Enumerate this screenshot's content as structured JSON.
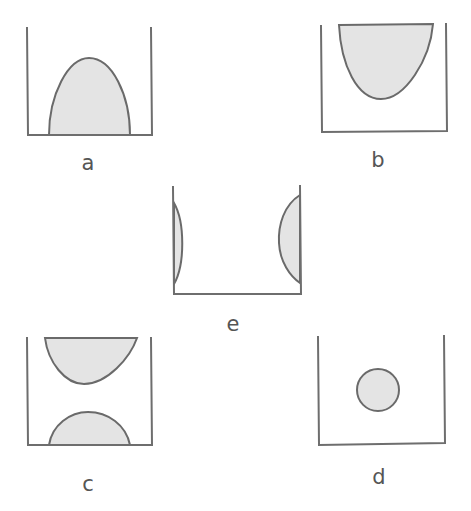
{
  "figure": {
    "colors": {
      "wall": "#6e6e6e",
      "fill": "#e4e4e4",
      "outline": "#6a6a6a",
      "label": "#555555"
    },
    "panels": [
      {
        "id": "a",
        "label": "a",
        "shape": "dome resting on bottom"
      },
      {
        "id": "b",
        "label": "b",
        "shape": "hanging bowl from top"
      },
      {
        "id": "e",
        "label": "e",
        "shape": "lenses attached to side walls"
      },
      {
        "id": "c",
        "label": "c",
        "shape": "bowl at top and dome at bottom"
      },
      {
        "id": "d",
        "label": "d",
        "shape": "floating circle in center"
      }
    ]
  }
}
